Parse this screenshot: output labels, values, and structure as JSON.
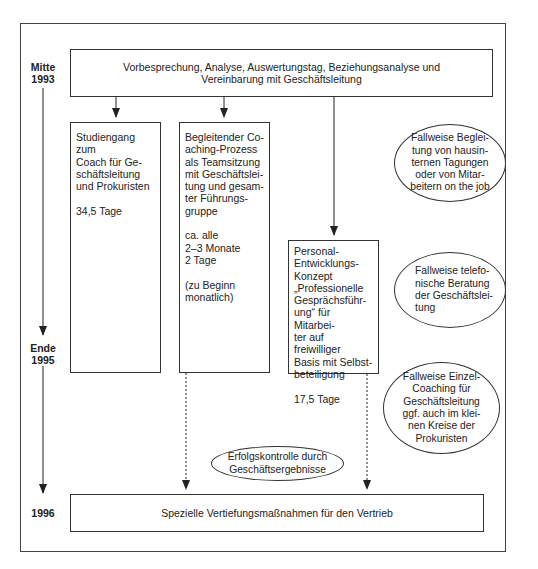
{
  "timeline": {
    "start_label": "Mitte\n1993",
    "mid_label": "Ende\n1995",
    "end_label": "1996"
  },
  "top_box": {
    "text_line1": "Vorbesprechung, Analyse, Auswertungstag, Beziehungsanalyse und",
    "text_line2": "Vereinbarung mit Geschäftsleitung"
  },
  "columns": [
    {
      "text": "Studiengang zum\nCoach für Ge-\nschäftsleitung\nund Prokuristen\n\n34,5 Tage"
    },
    {
      "text": "Begleitender Co-\naching-Prozess\nals Teamsitzung\nmit Geschäftslei-\ntung und gesam-\nter Führungs-\ngruppe\n\nca. alle\n2–3 Monate\n2 Tage\n\n(zu Beginn\nmonatlich)"
    },
    {
      "text": "Personal-\nEntwicklungs-\nKonzept\n„Professionelle\nGesprächsführ-\nung“ für Mitarbei-\nter auf freiwilliger\nBasis mit Selbst-\nbeteiligung\n\n17,5 Tage"
    }
  ],
  "ellipses": [
    {
      "text": "Fallweise Beglei-\ntung von hausin-\nternen Tagungen\noder von Mitar-\nbeitern on the job"
    },
    {
      "text": "Fallweise telefo-\nnische Beratung\nder Geschäftslei-\ntung"
    },
    {
      "text": "Fallweise Einzel-\nCoaching für\nGeschäftsleitung\nggf. auch im klei-\nnen Kreise der\nProkuristen"
    }
  ],
  "control_ellipse": {
    "text": "Erfolgskontrolle durch\nGeschäftsergebnisse"
  },
  "bottom_box": {
    "text": "Spezielle Vertiefungsmaßnahmen für den Vertrieb"
  }
}
